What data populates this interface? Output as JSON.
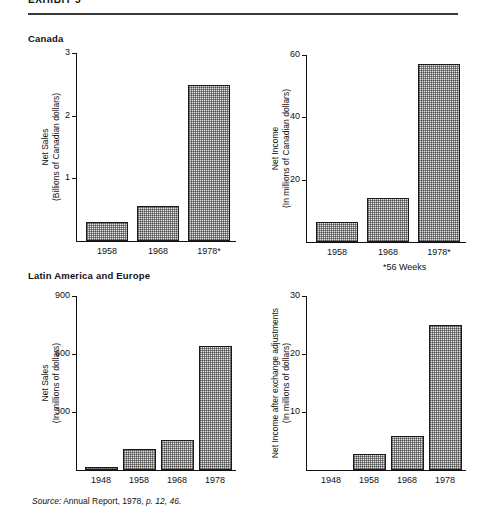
{
  "exhibit": {
    "title": "EXHIBIT 5",
    "rule": "horizontal-rule"
  },
  "sections": {
    "canada": "Canada",
    "latam": "Latin America and Europe"
  },
  "footnotes": {
    "weeks": "*56 Weeks"
  },
  "source": {
    "label": "Source:",
    "body": " Annual Report, 1978, ",
    "pages": "p. 12, 46."
  },
  "chart_data": [
    {
      "id": "canada-net-sales",
      "type": "bar",
      "title": "",
      "section": "Canada",
      "ylabel_line1": "Net Sales",
      "ylabel_line2": "(Billions of Canadian dollars)",
      "xlabel": "",
      "categories": [
        "1958",
        "1968",
        "1978*"
      ],
      "values": [
        0.3,
        0.56,
        2.49
      ],
      "yticks": [
        1,
        2,
        3
      ],
      "ytick_labels": [
        "1",
        "2",
        "3"
      ],
      "ylim": [
        0,
        3
      ],
      "grid": false,
      "legend": "none"
    },
    {
      "id": "canada-net-income",
      "type": "bar",
      "title": "",
      "section": "Canada",
      "ylabel_line1": "Net Income",
      "ylabel_line2": "(In millions of Canadian dollars)",
      "xlabel": "",
      "categories": [
        "1958",
        "1968",
        "1978*"
      ],
      "values": [
        6.5,
        14,
        57
      ],
      "yticks": [
        20,
        40,
        60
      ],
      "ytick_labels": [
        "20",
        "40",
        "60"
      ],
      "ylim": [
        0,
        60
      ],
      "grid": false,
      "legend": "none"
    },
    {
      "id": "latam-net-sales",
      "type": "bar",
      "title": "",
      "section": "Latin America and Europe",
      "ylabel_line1": "Net Sales",
      "ylabel_line2": "(In millions of dollars)",
      "xlabel": "",
      "categories": [
        "1948",
        "1958",
        "1968",
        "1978"
      ],
      "values": [
        15,
        110,
        155,
        640
      ],
      "yticks": [
        300,
        600,
        900
      ],
      "ytick_labels": [
        "300",
        "600",
        "900"
      ],
      "ylim": [
        0,
        900
      ],
      "grid": false,
      "legend": "none"
    },
    {
      "id": "latam-net-income",
      "type": "bar",
      "title": "",
      "section": "Latin America and Europe",
      "ylabel_line1": "Net Income after exchange adjustments",
      "ylabel_line2": "(In millions of dollars)",
      "xlabel": "",
      "categories": [
        "1948",
        "1958",
        "1968",
        "1978"
      ],
      "values": [
        0,
        2.8,
        5.8,
        25
      ],
      "yticks": [
        10,
        20,
        30
      ],
      "ytick_labels": [
        "10",
        "20",
        "30"
      ],
      "ylim": [
        0,
        30
      ],
      "grid": false,
      "legend": "none"
    }
  ]
}
